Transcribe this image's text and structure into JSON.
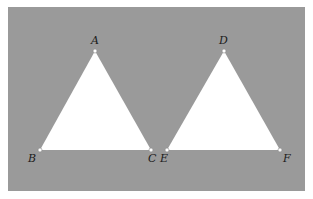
{
  "diagram": {
    "background_color": "#9a9a9a",
    "fill_color": "#ffffff",
    "triangles": [
      {
        "name": "ABC",
        "vertices": [
          {
            "label": "A",
            "x": 95,
            "y": 51
          },
          {
            "label": "B",
            "x": 40,
            "y": 150
          },
          {
            "label": "C",
            "x": 151,
            "y": 150
          }
        ]
      },
      {
        "name": "DEF",
        "vertices": [
          {
            "label": "D",
            "x": 224,
            "y": 51
          },
          {
            "label": "E",
            "x": 167,
            "y": 150
          },
          {
            "label": "F",
            "x": 280,
            "y": 150
          }
        ]
      }
    ],
    "labels": {
      "A": "A",
      "B": "B",
      "C": "C",
      "D": "D",
      "E": "E",
      "F": "F"
    }
  }
}
